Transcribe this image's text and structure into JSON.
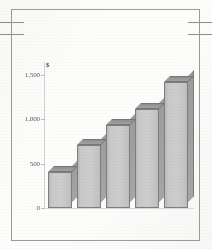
{
  "chart_data": {
    "type": "bar",
    "title": "",
    "subtitle": "",
    "xlabel": "",
    "ylabel": "",
    "unit_symbol": "$",
    "categories": [
      "1",
      "2",
      "3",
      "4",
      "5"
    ],
    "values": [
      470,
      780,
      1000,
      1185,
      1490
    ],
    "series": [
      {
        "name": "",
        "values": [
          470,
          780,
          1000,
          1185,
          1490
        ]
      }
    ],
    "ylim": [
      0,
      1600
    ],
    "ytick_labels": [
      "1,500",
      "1,000",
      "500",
      "0"
    ],
    "ytick_values": [
      1500,
      1000,
      500,
      0
    ],
    "grid": false,
    "legend": false,
    "legend_position": "none",
    "three_d": true,
    "bar_face_color": "#cdcdcd",
    "bar_side_color": "#a3a3a3",
    "bar_top_color": "#9a9a9a",
    "bar_outline_color": "#7e7e7e",
    "axis_color": "#d2d2d2",
    "label_color": "#5a5a5a"
  },
  "figure": {
    "frame_color": "#9a9a9a",
    "background_color": "#fdfdfc",
    "edge_rule_color": "#8e8e8e"
  }
}
